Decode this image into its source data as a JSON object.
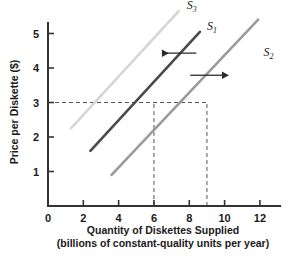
{
  "chart_data": {
    "type": "line",
    "title": "",
    "xlabel": "Quantity of Diskettes Supplied",
    "xlabel_line2": "(billions of constant-quality units per year)",
    "ylabel": "Price per Diskette ($)",
    "xlim": [
      0,
      13.2
    ],
    "ylim": [
      0,
      5.85
    ],
    "grid": false,
    "legend_position": "inline-curve-labels",
    "x_ticks": [
      0,
      2,
      4,
      6,
      8,
      10,
      12
    ],
    "x_tick_labels": [
      "0",
      "2",
      "4",
      "6",
      "8",
      "10",
      "12"
    ],
    "y_ticks": [
      1,
      2,
      3,
      4,
      5
    ],
    "y_tick_labels": [
      "1",
      "2",
      "3",
      "4",
      "5"
    ],
    "series": [
      {
        "name": "S1",
        "label": "S",
        "subscript": "1",
        "color": "#4a4a4a",
        "role": "original supply",
        "x": [
          2.4,
          8.6
        ],
        "y": [
          1.6,
          5.05
        ],
        "label_x": 9.0,
        "label_y": 5.1
      },
      {
        "name": "S2",
        "label": "S",
        "subscript": "2",
        "color": "#9b9b9b",
        "role": "increase in supply (rightward shift)",
        "x": [
          3.6,
          11.9
        ],
        "y": [
          0.9,
          5.4
        ],
        "label_x": 12.2,
        "label_y": 4.35
      },
      {
        "name": "S3",
        "label": "S",
        "subscript": "3",
        "color": "#d6d6d6",
        "role": "decrease in supply (leftward shift)",
        "x": [
          1.3,
          7.4
        ],
        "y": [
          2.25,
          5.65
        ],
        "label_x": 7.85,
        "label_y": 5.7
      }
    ],
    "reference_lines": [
      {
        "name": "price-3-horizontal",
        "orientation": "horizontal",
        "value": 3,
        "from": 0,
        "to": 9,
        "style": "dashed"
      },
      {
        "name": "quantity-6-vertical",
        "orientation": "vertical",
        "value": 6,
        "from": 0,
        "to": 3,
        "style": "dashed"
      },
      {
        "name": "quantity-9-vertical",
        "orientation": "vertical",
        "value": 9,
        "from": 0,
        "to": 3,
        "style": "dashed"
      }
    ],
    "annotations": [
      {
        "name": "leftward-shift-arrow",
        "direction": "left",
        "meaning": "supply decreases from S1 to S3",
        "x_start": 8.4,
        "x_end": 6.45,
        "y": 4.43
      },
      {
        "name": "rightward-shift-arrow",
        "direction": "right",
        "meaning": "supply increases from S1 to S2",
        "x_start": 8.05,
        "x_end": 9.85,
        "y": 3.79
      }
    ],
    "equilibrium_points": [
      {
        "label": "S1 at P=3",
        "x": 6,
        "y": 3
      },
      {
        "label": "S2 at P=3",
        "x": 9,
        "y": 3
      }
    ]
  },
  "axis": {
    "axis_color": "#333333",
    "dash_color": "#555555"
  }
}
